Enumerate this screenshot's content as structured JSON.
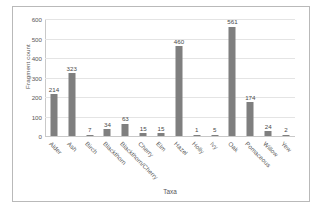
{
  "chart_data": {
    "type": "bar",
    "title": "",
    "xlabel": "Taxa",
    "ylabel": "Fragment count",
    "ylim": [
      0,
      600
    ],
    "ytick_labels": [
      "600",
      "500",
      "400",
      "300",
      "200",
      "100",
      "0"
    ],
    "ytick_values": [
      600,
      500,
      400,
      300,
      200,
      100,
      0
    ],
    "grid": true,
    "legend": "none",
    "bar_color": "#7f7f7f",
    "categories": [
      "Alder",
      "Ash",
      "Birch",
      "Blackthorn",
      "Blackthorn/Cherry",
      "Cherry",
      "Elm",
      "Hazel",
      "Holly",
      "Ivy",
      "Oak",
      "Pomaceous",
      "Willow",
      "Yew"
    ],
    "values": [
      214,
      323,
      7,
      34,
      63,
      15,
      15,
      460,
      1,
      5,
      561,
      174,
      24,
      2
    ],
    "data_labels": [
      "214",
      "323",
      "7",
      "34",
      "63",
      "15",
      "15",
      "460",
      "1",
      "5",
      "561",
      "174",
      "24",
      "2"
    ]
  }
}
